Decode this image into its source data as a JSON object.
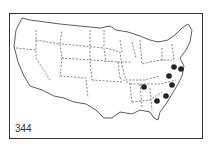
{
  "map": {
    "label": "344",
    "region": "United States",
    "colors": {
      "ink": "#222222",
      "background": "#ffffff"
    },
    "markers": [
      {
        "x": 174,
        "y": 67
      },
      {
        "x": 181,
        "y": 69
      },
      {
        "x": 169,
        "y": 76
      },
      {
        "x": 144,
        "y": 87
      },
      {
        "x": 172,
        "y": 85
      },
      {
        "x": 166,
        "y": 96
      },
      {
        "x": 157,
        "y": 101
      }
    ]
  }
}
